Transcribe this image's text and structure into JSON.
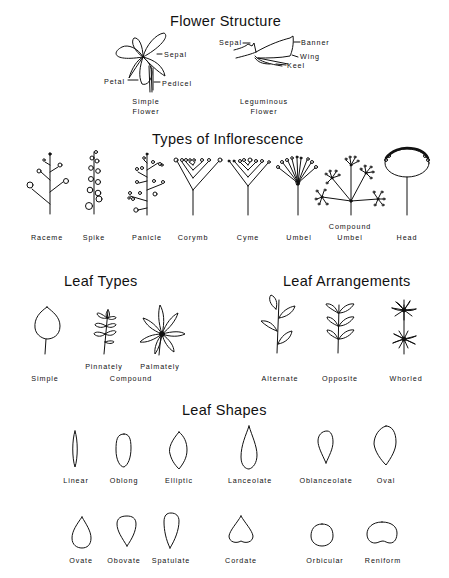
{
  "sections": {
    "flower_structure": {
      "title": "Flower Structure",
      "simple_flower": {
        "caption_line1": "Simple",
        "caption_line2": "Flower",
        "parts": [
          "Sepal",
          "Petal",
          "Pedicel"
        ]
      },
      "leguminous_flower": {
        "caption_line1": "Leguminous",
        "caption_line2": "Flower",
        "parts": [
          "Sepal",
          "Banner",
          "Wing",
          "Keel"
        ]
      }
    },
    "inflorescence": {
      "title": "Types of Inflorescence",
      "types": [
        "Raceme",
        "Spike",
        "Panicle",
        "Corymb",
        "Cyme",
        "Umbel",
        "Compound",
        "Umbel",
        "Head"
      ]
    },
    "leaf_types": {
      "title": "Leaf Types",
      "labels": [
        "Simple",
        "Pinnately",
        "Palmately",
        "Compound"
      ]
    },
    "leaf_arrangements": {
      "title": "Leaf Arrangements",
      "labels": [
        "Alternate",
        "Opposite",
        "Whorled"
      ]
    },
    "leaf_shapes": {
      "title": "Leaf Shapes",
      "row1": [
        "Linear",
        "Oblong",
        "Elliptic",
        "Lanceolate",
        "Oblanceolate",
        "Oval"
      ],
      "row2": [
        "Ovate",
        "Obovate",
        "Spatulate",
        "Cordate",
        "Orbicular",
        "Reniform"
      ]
    }
  }
}
